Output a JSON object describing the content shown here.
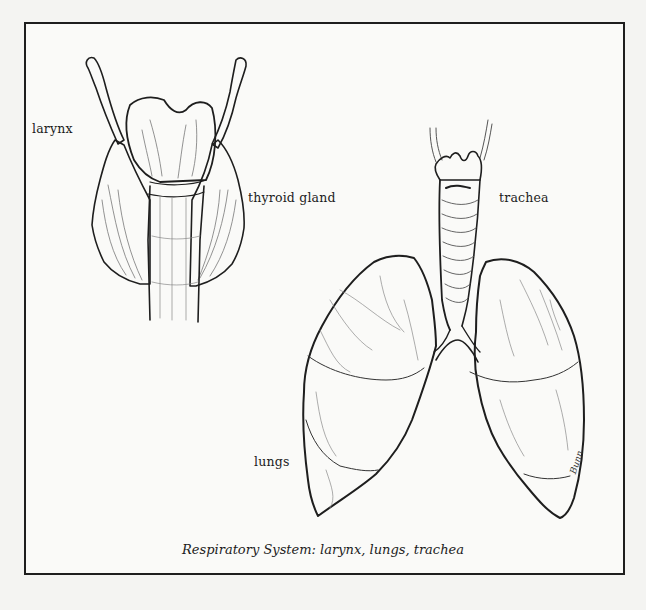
{
  "figure": {
    "caption": "Respiratory System: larynx, lungs, trachea",
    "labels": {
      "larynx": "larynx",
      "thyroid_gland": "thyroid gland",
      "trachea": "trachea",
      "lungs": "lungs"
    },
    "signature": "Bunn",
    "colors": {
      "ink": "#1e1e1e",
      "paper": "#fafaf8",
      "shade": "#8a8a8a"
    }
  }
}
